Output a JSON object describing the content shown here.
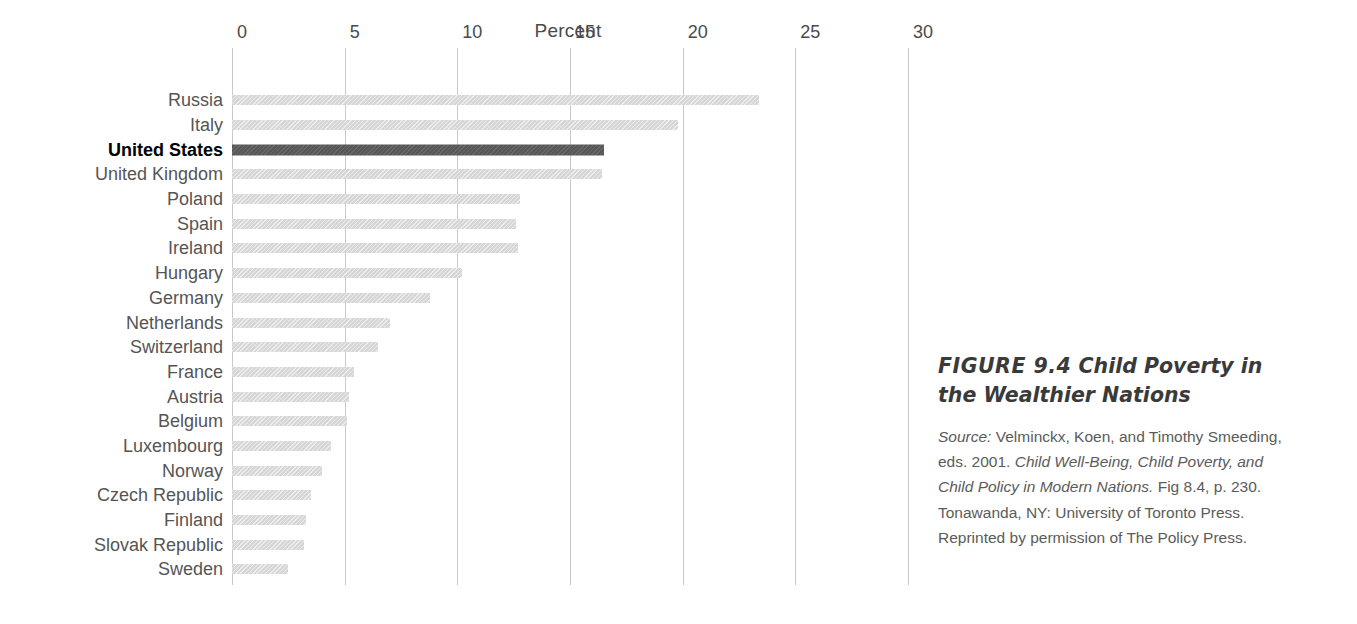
{
  "chart_data": {
    "type": "bar",
    "orientation": "horizontal",
    "title": "",
    "xlabel": "Percent",
    "ylabel": "",
    "xlim": [
      0,
      30
    ],
    "xticks": [
      0,
      5,
      10,
      15,
      20,
      25,
      30
    ],
    "xtick_labels": [
      "0",
      "5",
      "10",
      "15",
      "20",
      "25",
      "30"
    ],
    "grid": true,
    "legend": false,
    "highlight_category": "United States",
    "colors": {
      "bar": "#d6d6d6",
      "bar_highlight": "#575757",
      "gridline": "#c9c9c9",
      "label": "#555555",
      "label_highlight": "#000000"
    },
    "categories": [
      "Russia",
      "Italy",
      "United States",
      "United Kingdom",
      "Poland",
      "Spain",
      "Ireland",
      "Hungary",
      "Germany",
      "Netherlands",
      "Switzerland",
      "France",
      "Austria",
      "Belgium",
      "Luxembourg",
      "Norway",
      "Czech Republic",
      "Finland",
      "Slovak Republic",
      "Sweden"
    ],
    "values": [
      23.4,
      19.8,
      16.5,
      16.4,
      12.8,
      12.6,
      12.7,
      10.2,
      8.8,
      7.0,
      6.5,
      5.4,
      5.2,
      5.1,
      4.4,
      4.0,
      3.5,
      3.3,
      3.2,
      2.5
    ]
  },
  "caption": {
    "figure_number": "FIGURE 9.4",
    "figure_name": "Child Poverty in the Wealthier Nations",
    "source_label": "Source:",
    "source_part1": " Velminckx, Koen, and Timothy Smeeding, eds. 2001. ",
    "source_work": "Child Well-Being, Child Poverty, and Child Policy in Modern Nations.",
    "source_part2": " Fig 8.4, p. 230. Tonawanda, NY: University of Toronto Press. Reprinted by permission of The Policy Press."
  }
}
